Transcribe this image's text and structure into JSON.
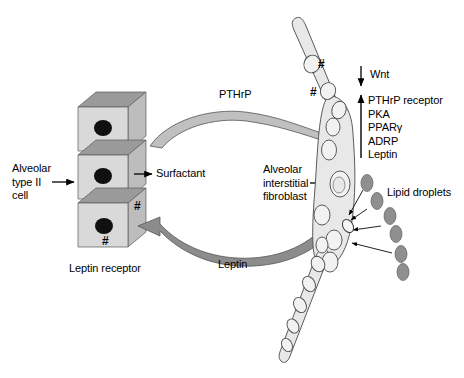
{
  "figure": {
    "background": "#ffffff"
  },
  "colors": {
    "cell_face": "#d9d9d9",
    "cell_top": "#9a9a9a",
    "cell_side": "#bdbdbd",
    "nucleus": "#101010",
    "pthrp_arrow": "#c0c0c0",
    "leptin_arrow": "#8c8c8c",
    "fibroblast_fill": "#e8e8e8",
    "vacuole_fill": "#f2f2f2",
    "lipid_droplet": "#8f8f8f",
    "outline": "#3a3a3a",
    "text": "#000000"
  },
  "labels": {
    "alveolar_type_ii_cell": "Alveolar\ntype II\ncell",
    "surfactant": "Surfactant",
    "leptin_receptor": "Leptin receptor",
    "pthrp": "PTHrP",
    "leptin": "Leptin",
    "alveolar_interstitial_fibroblast": "Alveolar\ninterstitial\nfibroblast",
    "lipid_droplets": "Lipid droplets",
    "wnt": "Wnt"
  },
  "upregulated_list": {
    "direction": "up",
    "items": [
      "PTHrP receptor",
      "PKA",
      "PPARγ",
      "ADRP",
      "Leptin"
    ]
  },
  "downregulated": {
    "direction": "down",
    "item": "Wnt"
  },
  "receptor_markers": {
    "symbol": "#",
    "count_on_epithelial_cell": 2,
    "count_on_fibroblast": 2,
    "meaning": "Leptin receptor"
  },
  "signals": [
    {
      "name": "PTHrP",
      "from": "alveolar type II cell",
      "to": "alveolar interstitial fibroblast",
      "direction": "rightward"
    },
    {
      "name": "Leptin",
      "from": "alveolar interstitial fibroblast",
      "to": "alveolar type II cell",
      "direction": "leftward"
    },
    {
      "name": "Surfactant",
      "from": "alveolar type II cell",
      "to": "alveolar space",
      "direction": "rightward"
    }
  ],
  "lipid_droplets": {
    "count": 8,
    "target": "alveolar interstitial fibroblast"
  }
}
